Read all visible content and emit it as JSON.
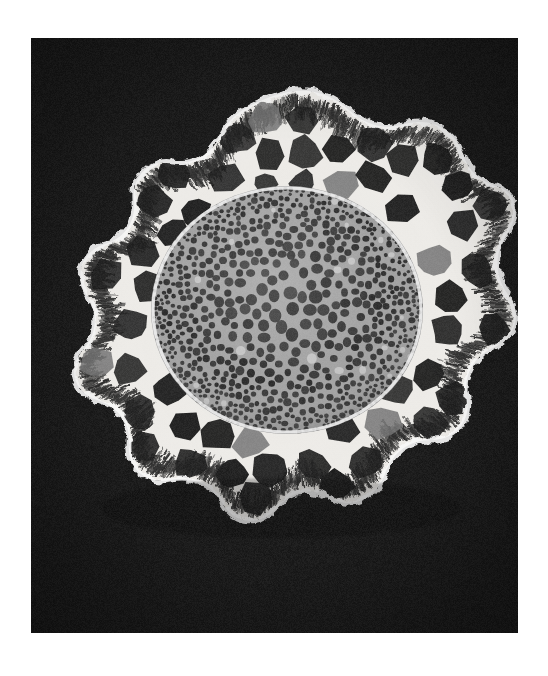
{
  "page": {
    "background_color": "#ffffff",
    "width": 548,
    "height": 676
  },
  "plate": {
    "background_color": "#121212",
    "x": 31,
    "y": 38,
    "width": 487,
    "height": 595,
    "caption": "",
    "scale_bar_label": "",
    "magnification_label": ""
  },
  "micrograph": {
    "type": "scanning-electron-micrograph",
    "subject": "plant stem cross-section",
    "orientation": "transverse section",
    "tone": "grayscale",
    "regions": [
      {
        "name": "background",
        "label": "black specimen-stub background",
        "fill": "#121212"
      },
      {
        "name": "epidermis",
        "label": "outer epidermal rind with ragged broken margin",
        "fill": "#f2f2f2"
      },
      {
        "name": "cortex",
        "label": "cortical parenchyma with large polygonal lacunae",
        "wall_fill": "#e8e8e8",
        "lumen_fill": "#141414"
      },
      {
        "name": "vascular-cylinder",
        "label": "central vascular cylinder / stele with dense small cells",
        "matrix_fill": "#9a9a9a",
        "cell_fill": "#1c1c1c"
      }
    ],
    "outline": {
      "shape": "irregular lobed disc",
      "lobe_count": 6
    }
  },
  "colors": {
    "paper": "#ffffff",
    "plate_black": "#121212",
    "tissue_white": "#f4f4f4",
    "tissue_gray": "#9a9a9a",
    "lumen_black": "#141414"
  }
}
